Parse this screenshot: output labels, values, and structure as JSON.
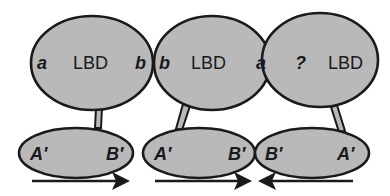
{
  "colors": {
    "fill": "#b9b9b9",
    "stroke": "#1a1a1a",
    "background": "#ffffff"
  },
  "units": [
    {
      "lbd": {
        "label": "LBD",
        "left_site": "a",
        "right_site": "b"
      },
      "dbd": {
        "left_site": "A′",
        "right_site": "B′"
      },
      "arrow_direction": "right"
    },
    {
      "lbd": {
        "label": "LBD",
        "left_site": "b",
        "right_site": "a"
      },
      "dbd": {
        "left_site": "A′",
        "right_site": "B′"
      },
      "arrow_direction": "right"
    },
    {
      "lbd": {
        "label": "LBD",
        "left_site": "?",
        "right_site": ""
      },
      "dbd": {
        "left_site": "B′",
        "right_site": "A′"
      },
      "arrow_direction": "left"
    }
  ]
}
